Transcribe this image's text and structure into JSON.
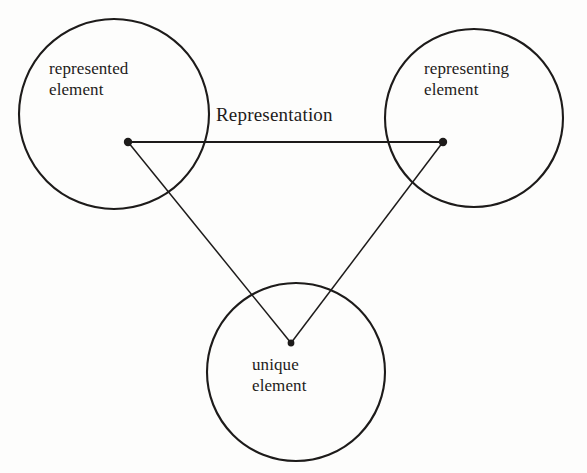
{
  "diagram": {
    "background_color": "#fdfdfc",
    "stroke_color": "#1d1b1a",
    "nodes": [
      {
        "id": "represented-element",
        "label_line1": "represented",
        "label_line2": "element",
        "label": "represented element",
        "circle": {
          "cx": 114,
          "cy": 114,
          "r": 95
        },
        "vertex": {
          "x": 128,
          "y": 142
        }
      },
      {
        "id": "representing-element",
        "label_line1": "representing",
        "label_line2": "element",
        "label": "representing element",
        "circle": {
          "cx": 474,
          "cy": 118,
          "r": 89
        },
        "vertex": {
          "x": 443,
          "y": 142
        }
      },
      {
        "id": "unique-element",
        "label_line1": "unique",
        "label_line2": "element",
        "label": "unique element",
        "circle": {
          "cx": 296,
          "cy": 372,
          "r": 89
        },
        "vertex": {
          "x": 291,
          "y": 343
        }
      }
    ],
    "edges": [
      {
        "id": "edge-represented-representing",
        "label": "Representation",
        "from": "represented-element",
        "to": "representing-element"
      },
      {
        "id": "edge-represented-unique",
        "label": "",
        "from": "represented-element",
        "to": "unique-element"
      },
      {
        "id": "edge-representing-unique",
        "label": "",
        "from": "representing-element",
        "to": "unique-element"
      }
    ]
  }
}
